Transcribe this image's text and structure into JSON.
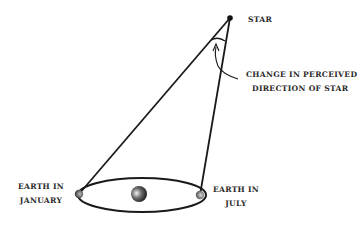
{
  "diagram": {
    "type": "stellar-parallax",
    "labels": {
      "star": "STAR",
      "annotation_line1": "CHANGE IN PERCEIVED",
      "annotation_line2": "DIRECTION OF STAR",
      "earth_january_line1": "EARTH IN",
      "earth_january_line2": "JANUARY",
      "earth_july_line1": "EARTH IN",
      "earth_july_line2": "JULY"
    },
    "nodes": {
      "star": {
        "x": 230,
        "y": 18
      },
      "earth_january": {
        "x": 79,
        "y": 194
      },
      "earth_july": {
        "x": 200,
        "y": 195
      },
      "sun": {
        "x": 139,
        "y": 194
      }
    },
    "orbit": {
      "cx": 142,
      "cy": 195,
      "rx": 64,
      "ry": 17
    },
    "colors": {
      "ink": "#1a1a1a",
      "text": "#2a2a2a",
      "background": "#ffffff"
    }
  }
}
